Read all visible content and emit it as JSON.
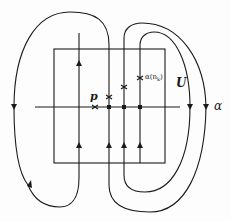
{
  "diagram": {
    "type": "topological flow diagram",
    "labels": {
      "p": "p",
      "alpha_nk": "α(n",
      "alpha_nk_sub": "k",
      "alpha_nk_close": ")",
      "U": "U",
      "alpha": "α"
    },
    "colors": {
      "stroke": "#1a1a1a",
      "background": "#fdfdfd"
    },
    "elements": {
      "rectangle": {
        "x": 54,
        "y": 49,
        "width": 111,
        "height": 114
      },
      "horizontal_axis": {
        "y": 107,
        "x1": 35,
        "x2": 180
      },
      "vertical_lines_x": [
        79,
        109,
        124,
        140
      ],
      "marked_points": [
        {
          "name": "p",
          "x": 95,
          "y": 107
        },
        {
          "name": "x1",
          "x": 109,
          "y": 97
        },
        {
          "name": "x2",
          "x": 124,
          "y": 87
        },
        {
          "name": "alpha(n_k)",
          "x": 140,
          "y": 78
        }
      ]
    }
  }
}
